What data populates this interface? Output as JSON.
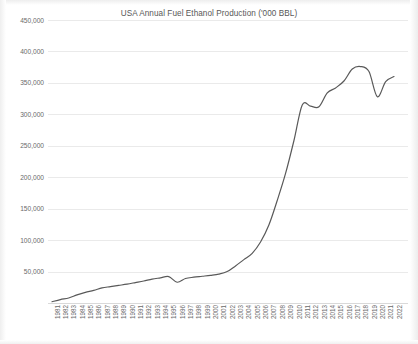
{
  "chart_data": {
    "type": "line",
    "title": "USA Annual Fuel Ethanol Production ('000 BBL)",
    "xlabel": "",
    "ylabel": "",
    "grid": true,
    "legend": false,
    "line_color": "#595959",
    "ylim": [
      0,
      450000
    ],
    "yticks": [
      50000,
      100000,
      150000,
      200000,
      250000,
      300000,
      350000,
      400000,
      450000
    ],
    "ytick_labels": [
      "50,000",
      "100,000",
      "150,000",
      "200,000",
      "250,000",
      "300,000",
      "350,000",
      "400,000",
      "450,000"
    ],
    "categories": [
      "1981",
      "1982",
      "1983",
      "1984",
      "1985",
      "1986",
      "1987",
      "1988",
      "1989",
      "1990",
      "1991",
      "1992",
      "1993",
      "1994",
      "1995",
      "1996",
      "1997",
      "1998",
      "1999",
      "2000",
      "2001",
      "2002",
      "2003",
      "2004",
      "2005",
      "2006",
      "2007",
      "2008",
      "2009",
      "2010",
      "2011",
      "2012",
      "2013",
      "2014",
      "2015",
      "2016",
      "2017",
      "2018",
      "2019",
      "2020",
      "2021",
      "2022"
    ],
    "series": [
      {
        "name": "USA Annual Fuel Ethanol Production",
        "values": [
          2000,
          5500,
          8000,
          13000,
          17000,
          20000,
          24000,
          26000,
          28000,
          30000,
          32500,
          35000,
          38000,
          40000,
          42000,
          33000,
          39000,
          41000,
          42500,
          44000,
          46000,
          50000,
          59000,
          69000,
          79000,
          97000,
          124000,
          163000,
          206000,
          258000,
          315000,
          313000,
          312000,
          334000,
          342000,
          353000,
          372000,
          376000,
          368000,
          328000,
          352000,
          360000
        ]
      }
    ]
  }
}
